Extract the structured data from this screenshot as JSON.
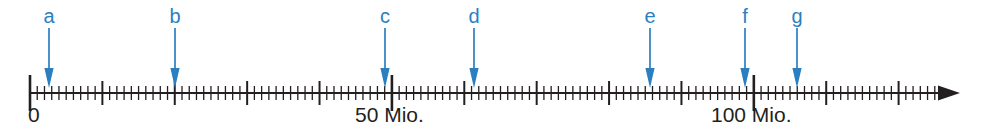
{
  "figure": {
    "name": "number-line-with-markers",
    "width": 982,
    "height": 136,
    "background_color": "#ffffff"
  },
  "axis": {
    "color": "#231f20",
    "origin_x": 30,
    "end_x": 960,
    "baseline_y": 93,
    "pixels_per_unit": 7.2383,
    "minor_tick_step": 1,
    "medium_tick_step": 10,
    "major_tick_step": 50,
    "min_value": 0,
    "max_value": 126,
    "minor_tick_height": 7,
    "medium_tick_height": 12,
    "major_tick_height": 18,
    "arrowhead": true,
    "labels": [
      {
        "text": "0",
        "value": 0,
        "x": 28,
        "y": 104
      },
      {
        "text": "50 Mio.",
        "value": 50,
        "x": 355,
        "y": 104
      },
      {
        "text": "100 Mio.",
        "value": 100,
        "x": 711,
        "y": 104
      }
    ]
  },
  "markers": {
    "color": "#2a7fc1",
    "label_y": 6,
    "arrow_top_y": 28,
    "arrow_tip_y": 88,
    "items": [
      {
        "id": "a",
        "label": "a",
        "value": 2.6,
        "x": 49
      },
      {
        "id": "b",
        "label": "b",
        "value": 20.0,
        "x": 175
      },
      {
        "id": "c",
        "label": "c",
        "value": 49.0,
        "x": 385
      },
      {
        "id": "d",
        "label": "d",
        "value": 61.3,
        "x": 474
      },
      {
        "id": "e",
        "label": "e",
        "value": 85.7,
        "x": 650
      },
      {
        "id": "f",
        "label": "f",
        "value": 98.7,
        "x": 745
      },
      {
        "id": "g",
        "label": "g",
        "value": 105.9,
        "x": 797
      }
    ]
  },
  "chart_data": {
    "type": "number-line",
    "title": "",
    "xlabel": "",
    "ylabel": "",
    "xlim": [
      0,
      126
    ],
    "unit": "Mio.",
    "tick_labels": [
      "0",
      "50 Mio.",
      "100 Mio."
    ],
    "tick_values": [
      0,
      50,
      100
    ],
    "minor_tick_step": 1,
    "medium_tick_step": 10,
    "major_tick_step": 50,
    "grid": false,
    "legend": "none",
    "series": [
      {
        "name": "markers",
        "labels": [
          "a",
          "b",
          "c",
          "d",
          "e",
          "f",
          "g"
        ],
        "values": [
          2.6,
          20.0,
          49.0,
          61.3,
          85.7,
          98.7,
          105.9
        ]
      }
    ]
  }
}
